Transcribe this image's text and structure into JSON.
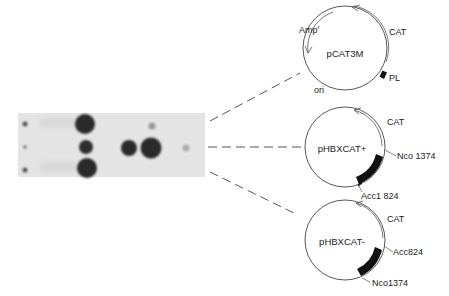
{
  "figure": {
    "gel": {
      "rows": 3,
      "spots": [
        {
          "x": 25,
          "y": 124,
          "r": 2.5,
          "shade": "#555"
        },
        {
          "x": 25,
          "y": 147,
          "r": 2,
          "shade": "#888"
        },
        {
          "x": 25,
          "y": 170,
          "r": 2.5,
          "shade": "#555"
        },
        {
          "x": 85,
          "y": 124,
          "r": 10,
          "shade": "#2a2a2a"
        },
        {
          "x": 86,
          "y": 147,
          "r": 7,
          "shade": "#2e2e2e"
        },
        {
          "x": 87,
          "y": 168,
          "r": 10,
          "shade": "#2a2a2a"
        },
        {
          "x": 129,
          "y": 148,
          "r": 8,
          "shade": "#2c2c2c"
        },
        {
          "x": 151,
          "y": 148,
          "r": 10.5,
          "shade": "#2a2a2a"
        },
        {
          "x": 152,
          "y": 126,
          "r": 3.5,
          "shade": "#999"
        },
        {
          "x": 186,
          "y": 148,
          "r": 3.5,
          "shade": "#aaa"
        }
      ]
    },
    "plasmids": [
      {
        "name": "pCAT3M",
        "labels": {
          "amp": "Amp",
          "amp_sup": "r",
          "cat": "CAT",
          "pl": "PL",
          "ori": "ori"
        }
      },
      {
        "name": "pHBXCAT+",
        "labels": {
          "cat": "CAT",
          "site1": "Nco 1374",
          "site2": "Acc1 824"
        }
      },
      {
        "name": "pHBXCAT-",
        "labels": {
          "cat": "CAT",
          "site1": "Acc824",
          "site2": "Nco1374"
        }
      }
    ]
  }
}
